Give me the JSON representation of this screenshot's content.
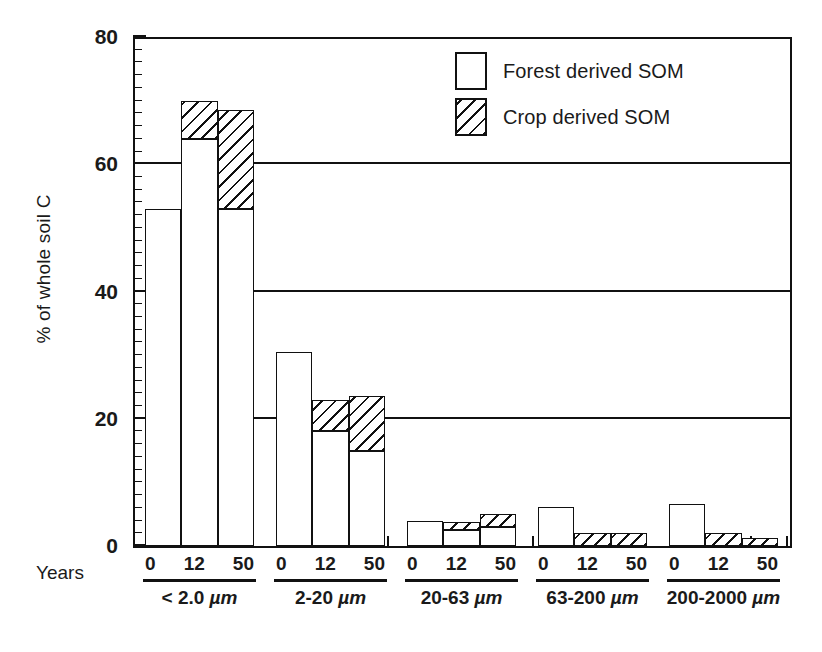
{
  "chart_data": {
    "type": "bar",
    "title": "",
    "subtitle": "",
    "xlabel": "Years",
    "ylabel": "% of whole soil C",
    "ylim": [
      0,
      80
    ],
    "yticks": [
      0,
      20,
      40,
      60,
      80
    ],
    "ytick_labels": [
      "0",
      "20",
      "40",
      "60",
      "80"
    ],
    "grid": "horizontal reference lines at 20, 40 and 60",
    "gridlines": [
      20,
      40,
      60
    ],
    "legend_position": "top-center-right",
    "stacked": true,
    "x_subcategories": [
      "0",
      "12",
      "50"
    ],
    "categories": [
      "< 2.0 µm",
      "2-20 µm",
      "20-63 µm",
      "63-200 µm",
      "200-2000 µm"
    ],
    "series": [
      {
        "name": "Forest derived SOM",
        "fill": "white",
        "values": [
          [
            53.0,
            64.0,
            53.0
          ],
          [
            30.5,
            18.0,
            15.0
          ],
          [
            4.0,
            2.5,
            3.0
          ],
          [
            6.2,
            0.0,
            0.0
          ],
          [
            6.6,
            0.0,
            0.0
          ]
        ]
      },
      {
        "name": "Crop derived SOM",
        "fill": "diagonal-hatch",
        "values": [
          [
            0.0,
            6.0,
            15.5
          ],
          [
            0.0,
            5.0,
            8.5
          ],
          [
            0.0,
            1.2,
            2.0
          ],
          [
            0.0,
            2.0,
            2.0
          ],
          [
            0.0,
            2.0,
            1.3
          ]
        ]
      }
    ],
    "totals": [
      [
        53.0,
        70.0,
        68.5
      ],
      [
        30.5,
        23.0,
        23.5
      ],
      [
        4.0,
        3.7,
        5.0
      ],
      [
        6.2,
        2.0,
        2.0
      ],
      [
        6.6,
        2.0,
        1.3
      ]
    ]
  },
  "axis": {
    "ylabel": "% of whole soil C",
    "years_label": "Years",
    "ytick_labels": [
      "80",
      "60",
      "40",
      "20",
      "0"
    ]
  },
  "legend": {
    "items": [
      {
        "label": "Forest derived SOM",
        "swatch": "white-square"
      },
      {
        "label": "Crop derived SOM",
        "swatch": "hatched-square"
      }
    ]
  },
  "groups": [
    {
      "name": "< 2.0 ",
      "unit": "µm",
      "years": [
        "0",
        "12",
        "50"
      ]
    },
    {
      "name": "2-20 ",
      "unit": "µm",
      "years": [
        "0",
        "12",
        "50"
      ]
    },
    {
      "name": "20-63 ",
      "unit": "µm",
      "years": [
        "0",
        "12",
        "50"
      ]
    },
    {
      "name": "63-200 ",
      "unit": "µm",
      "years": [
        "0",
        "12",
        "50"
      ]
    },
    {
      "name": "200-2000 ",
      "unit": "µm",
      "years": [
        "0",
        "12",
        "50"
      ]
    }
  ]
}
